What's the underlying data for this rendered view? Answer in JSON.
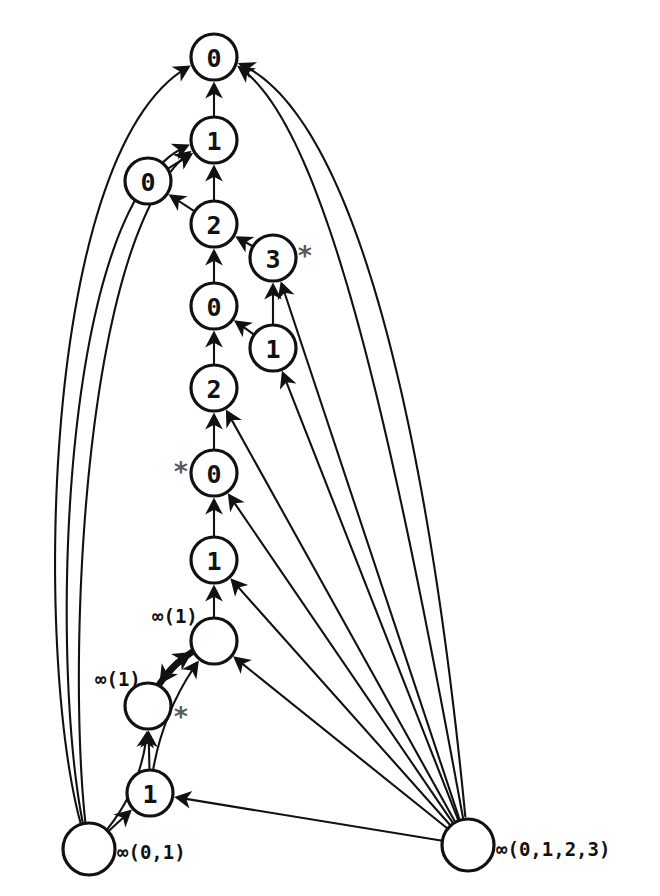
{
  "diagram": {
    "canvas": {
      "width": 660,
      "height": 896
    },
    "colors": {
      "stroke": "#111111",
      "node_fill": "#ffffff",
      "star": "#5a5a5a",
      "background": "#ffffff"
    },
    "nodes": [
      {
        "id": "n0_top",
        "label": "0",
        "cx": 214,
        "cy": 57,
        "r": 23,
        "empty": false
      },
      {
        "id": "n1_top",
        "label": "1",
        "cx": 214,
        "cy": 140,
        "r": 23,
        "empty": false
      },
      {
        "id": "n0_side",
        "label": "0",
        "cx": 148,
        "cy": 181,
        "r": 23,
        "empty": false
      },
      {
        "id": "n2_a",
        "label": "2",
        "cx": 214,
        "cy": 224,
        "r": 23,
        "empty": false
      },
      {
        "id": "n3_star",
        "label": "3",
        "cx": 273,
        "cy": 258,
        "r": 23,
        "empty": false
      },
      {
        "id": "n0_a",
        "label": "0",
        "cx": 214,
        "cy": 306,
        "r": 23,
        "empty": false
      },
      {
        "id": "n1_mid",
        "label": "1",
        "cx": 273,
        "cy": 348,
        "r": 23,
        "empty": false
      },
      {
        "id": "n2_b",
        "label": "2",
        "cx": 214,
        "cy": 388,
        "r": 23,
        "empty": false
      },
      {
        "id": "n0_star",
        "label": "0",
        "cx": 214,
        "cy": 473,
        "r": 23,
        "empty": false
      },
      {
        "id": "n1_low",
        "label": "1",
        "cx": 214,
        "cy": 560,
        "r": 23,
        "empty": false
      },
      {
        "id": "ninf_up",
        "label": "",
        "cx": 214,
        "cy": 641,
        "r": 23,
        "empty": true
      },
      {
        "id": "ninf_star",
        "label": "",
        "cx": 148,
        "cy": 706,
        "r": 23,
        "empty": true
      },
      {
        "id": "n1_bot",
        "label": "1",
        "cx": 150,
        "cy": 793,
        "r": 23,
        "empty": false
      },
      {
        "id": "ninf_bl",
        "label": "",
        "cx": 89,
        "cy": 849,
        "r": 26,
        "empty": true
      },
      {
        "id": "ninf_br",
        "label": "",
        "cx": 468,
        "cy": 845,
        "r": 26,
        "empty": true
      }
    ],
    "star_marks": [
      {
        "for": "n3_star",
        "text": "*",
        "x": 305,
        "y": 255
      },
      {
        "for": "n0_star",
        "text": "*",
        "x": 181,
        "y": 471
      },
      {
        "for": "ninf_star",
        "text": "*",
        "x": 181,
        "y": 716
      }
    ],
    "set_labels": [
      {
        "for": "ninf_up",
        "text": "∞(1)",
        "x": 152,
        "y": 616,
        "anchor": "start"
      },
      {
        "for": "ninf_star",
        "text": "∞(1)",
        "x": 95,
        "y": 679,
        "anchor": "start"
      },
      {
        "for": "ninf_bl",
        "text": "∞(0,1)",
        "x": 117,
        "y": 852,
        "anchor": "start"
      },
      {
        "for": "ninf_br",
        "text": "∞(0,1,2,3)",
        "x": 496,
        "y": 849,
        "anchor": "start"
      }
    ],
    "edges": [
      {
        "from": "n1_top",
        "to": "n0_top",
        "kind": "straight"
      },
      {
        "from": "n2_a",
        "to": "n1_top",
        "kind": "straight"
      },
      {
        "from": "n0_side",
        "to": "n1_top",
        "kind": "straight"
      },
      {
        "from": "n2_a",
        "to": "n0_side",
        "kind": "straight"
      },
      {
        "from": "n0_a",
        "to": "n2_a",
        "kind": "straight"
      },
      {
        "from": "n3_star",
        "to": "n2_a",
        "kind": "straight"
      },
      {
        "from": "n2_b",
        "to": "n0_a",
        "kind": "straight"
      },
      {
        "from": "n1_mid",
        "to": "n0_a",
        "kind": "straight"
      },
      {
        "from": "n1_mid",
        "to": "n3_star",
        "kind": "straight"
      },
      {
        "from": "n0_star",
        "to": "n2_b",
        "kind": "straight"
      },
      {
        "from": "n1_low",
        "to": "n0_star",
        "kind": "straight"
      },
      {
        "from": "ninf_up",
        "to": "n1_low",
        "kind": "straight"
      },
      {
        "from": "ninf_up",
        "to": "ninf_star",
        "kind": "bold-curve"
      },
      {
        "from": "ninf_star",
        "to": "ninf_up",
        "kind": "bold-curve"
      },
      {
        "from": "n1_bot",
        "to": "ninf_star",
        "kind": "straight"
      },
      {
        "from": "n1_bot",
        "to": "ninf_up",
        "kind": "curve"
      },
      {
        "from": "ninf_bl",
        "to": "n1_bot",
        "kind": "straight"
      },
      {
        "from": "ninf_bl",
        "to": "ninf_star",
        "kind": "curve"
      },
      {
        "from": "ninf_bl",
        "to": "n0_top",
        "kind": "long-left-curve"
      },
      {
        "from": "ninf_bl",
        "to": "n1_top",
        "kind": "long-left-curve"
      },
      {
        "from": "ninf_bl",
        "to": "n1_top",
        "kind": "long-left-curve"
      },
      {
        "from": "ninf_br",
        "to": "n1_bot",
        "kind": "straight"
      },
      {
        "from": "ninf_br",
        "to": "ninf_up",
        "kind": "straight"
      },
      {
        "from": "ninf_br",
        "to": "n1_low",
        "kind": "straight"
      },
      {
        "from": "ninf_br",
        "to": "n0_star",
        "kind": "straight"
      },
      {
        "from": "ninf_br",
        "to": "n2_b",
        "kind": "straight"
      },
      {
        "from": "ninf_br",
        "to": "n1_mid",
        "kind": "straight"
      },
      {
        "from": "ninf_br",
        "to": "n3_star",
        "kind": "straight"
      },
      {
        "from": "ninf_br",
        "to": "n0_top",
        "kind": "long-right-curve"
      },
      {
        "from": "ninf_br",
        "to": "n0_top",
        "kind": "long-right-curve"
      }
    ]
  }
}
